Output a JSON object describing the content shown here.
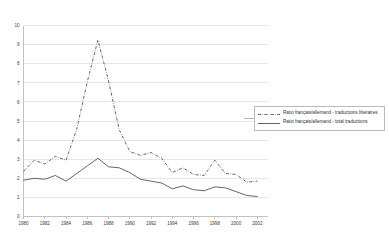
{
  "chart_data": {
    "type": "line",
    "title": "",
    "subtitle": "",
    "xlabel": "",
    "ylabel": "",
    "xlim": [
      1980,
      2003
    ],
    "ylim": [
      0,
      10
    ],
    "ytick_step": 1,
    "xtick_step": 2,
    "grid": true,
    "legend_position": "right",
    "x": [
      1980,
      1981,
      1982,
      1983,
      1984,
      1985,
      1986,
      1987,
      1988,
      1989,
      1990,
      1991,
      1992,
      1993,
      1994,
      1995,
      1996,
      1997,
      1998,
      1999,
      2000,
      2001,
      2002
    ],
    "xtick_labels": [
      "1980",
      "1982",
      "1984",
      "1986",
      "1988",
      "1990",
      "1992",
      "1994",
      "1996",
      "1998",
      "2000",
      "2002"
    ],
    "ytick_labels": [
      "0",
      "1",
      "2",
      "3",
      "4",
      "5",
      "6",
      "7",
      "8",
      "9",
      "10"
    ],
    "series": [
      {
        "name": "Ratio français/allemand - traductions littéraires",
        "style": "dash-dot",
        "color": "#4a4a4a",
        "values": [
          2.35,
          2.95,
          2.75,
          3.15,
          2.95,
          4.55,
          7.05,
          9.25,
          7.1,
          4.55,
          3.4,
          3.2,
          3.35,
          3.05,
          2.3,
          2.55,
          2.2,
          2.15,
          2.95,
          2.25,
          2.2,
          1.8,
          1.85
        ]
      },
      {
        "name": "Ratio français/allemand - total traductions",
        "style": "solid",
        "color": "#4a4a4a",
        "values": [
          1.9,
          2.0,
          1.95,
          2.15,
          1.85,
          2.25,
          2.65,
          3.05,
          2.6,
          2.55,
          2.3,
          1.95,
          1.85,
          1.75,
          1.45,
          1.6,
          1.4,
          1.35,
          1.55,
          1.5,
          1.3,
          1.1,
          1.05
        ]
      }
    ],
    "legend": [
      {
        "label_line1": "Ratio français/allemand - traductions",
        "label_line2": "littéraires",
        "style": "dash-dot"
      },
      {
        "label_line1": "Ratio français/allemand - total traductions",
        "label_line2": "",
        "style": "solid"
      }
    ]
  }
}
